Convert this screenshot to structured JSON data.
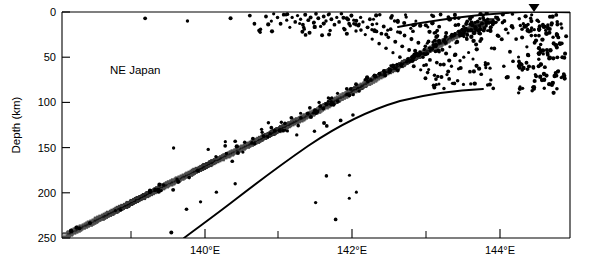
{
  "figure": {
    "region_label": "NE Japan",
    "background_color": "#ffffff",
    "ink_color": "#000000"
  },
  "chart_data": {
    "type": "scatter",
    "title": "",
    "subtitle": "",
    "annotations": [
      {
        "text": "NE Japan",
        "x": 138.75,
        "y": 62,
        "role": "region-label"
      },
      {
        "text": "▼",
        "x": 144.45,
        "y": 0,
        "role": "volcanic-front-marker"
      }
    ],
    "xlabel": "",
    "ylabel": "Depth (km)",
    "xlim": [
      138.3,
      144.9
    ],
    "ylim": [
      250,
      0
    ],
    "y_inverted": true,
    "grid": false,
    "legend": null,
    "xticks": [
      140,
      142,
      144
    ],
    "xtick_labels": [
      "140°E",
      "142°E",
      "144°E"
    ],
    "x_minor_ticks": [
      139,
      141,
      143
    ],
    "yticks": [
      0,
      50,
      100,
      150,
      200,
      250
    ],
    "ytick_labels": [
      "0",
      "50",
      "100",
      "150",
      "200",
      "250"
    ],
    "series": [
      {
        "name": "earthquake hypocenters",
        "marker": "filled-circle",
        "color": "#000000",
        "points": [
          [
            139.38,
            7
          ],
          [
            139.93,
            10
          ],
          [
            140.49,
            7
          ],
          [
            140.74,
            4
          ],
          [
            140.8,
            13
          ],
          [
            140.88,
            19
          ],
          [
            140.95,
            5
          ],
          [
            141.02,
            10
          ],
          [
            141.05,
            2
          ],
          [
            141.1,
            6
          ],
          [
            141.14,
            13
          ],
          [
            141.18,
            3
          ],
          [
            141.22,
            9
          ],
          [
            141.26,
            17
          ],
          [
            141.29,
            6
          ],
          [
            141.33,
            11
          ],
          [
            141.36,
            4
          ],
          [
            141.4,
            8
          ],
          [
            141.43,
            14
          ],
          [
            141.46,
            3
          ],
          [
            141.5,
            9
          ],
          [
            141.53,
            6
          ],
          [
            141.57,
            12
          ],
          [
            141.6,
            2
          ],
          [
            141.63,
            7
          ],
          [
            141.66,
            16
          ],
          [
            141.7,
            5
          ],
          [
            141.73,
            10
          ],
          [
            141.76,
            3
          ],
          [
            141.8,
            8
          ],
          [
            141.84,
            14
          ],
          [
            141.87,
            6
          ],
          [
            141.9,
            11
          ],
          [
            141.93,
            2
          ],
          [
            141.96,
            18
          ],
          [
            142.0,
            7
          ],
          [
            142.03,
            13
          ],
          [
            142.06,
            4
          ],
          [
            142.09,
            9
          ],
          [
            142.12,
            21
          ],
          [
            142.15,
            15
          ],
          [
            142.18,
            6
          ],
          [
            142.21,
            11
          ],
          [
            142.24,
            25
          ],
          [
            142.27,
            17
          ],
          [
            142.3,
            8
          ],
          [
            142.33,
            30
          ],
          [
            142.36,
            20
          ],
          [
            142.39,
            13
          ],
          [
            142.42,
            35
          ],
          [
            142.45,
            24
          ],
          [
            142.48,
            16
          ],
          [
            142.51,
            40
          ],
          [
            142.54,
            28
          ],
          [
            142.57,
            19
          ],
          [
            142.6,
            45
          ],
          [
            142.63,
            33
          ],
          [
            142.66,
            22
          ],
          [
            142.69,
            50
          ],
          [
            142.72,
            38
          ],
          [
            142.75,
            26
          ],
          [
            142.78,
            55
          ],
          [
            142.81,
            42
          ],
          [
            142.84,
            30
          ],
          [
            142.87,
            60
          ],
          [
            142.9,
            46
          ],
          [
            142.93,
            34
          ],
          [
            142.96,
            64
          ],
          [
            142.99,
            50
          ],
          [
            143.02,
            38
          ],
          [
            143.05,
            67
          ],
          [
            143.08,
            53
          ],
          [
            143.11,
            41
          ],
          [
            143.14,
            70
          ],
          [
            143.17,
            56
          ],
          [
            143.2,
            44
          ],
          [
            143.23,
            72
          ],
          [
            143.26,
            58
          ],
          [
            143.29,
            46
          ],
          [
            143.33,
            74
          ],
          [
            143.36,
            60
          ],
          [
            143.4,
            48
          ],
          [
            143.44,
            76
          ],
          [
            143.48,
            62
          ],
          [
            143.52,
            50
          ],
          [
            143.56,
            30
          ],
          [
            143.6,
            66
          ],
          [
            143.64,
            52
          ],
          [
            143.68,
            36
          ],
          [
            143.72,
            20
          ],
          [
            143.8,
            56
          ],
          [
            143.88,
            40
          ],
          [
            143.96,
            26
          ],
          [
            144.04,
            60
          ],
          [
            144.12,
            44
          ],
          [
            144.2,
            30
          ],
          [
            144.28,
            64
          ],
          [
            144.36,
            48
          ],
          [
            144.44,
            34
          ],
          [
            144.52,
            58
          ],
          [
            144.6,
            42
          ],
          [
            144.68,
            28
          ],
          [
            144.74,
            66
          ],
          [
            144.8,
            50
          ],
          [
            140.2,
            152
          ],
          [
            140.3,
            160
          ],
          [
            140.42,
            148
          ],
          [
            140.55,
            143
          ],
          [
            140.65,
            155
          ],
          [
            140.78,
            140
          ],
          [
            140.9,
            133
          ],
          [
            141.02,
            128
          ],
          [
            141.15,
            122
          ],
          [
            141.28,
            117
          ],
          [
            141.4,
            112
          ],
          [
            141.52,
            106
          ],
          [
            141.64,
            100
          ],
          [
            141.76,
            95
          ],
          [
            141.88,
            90
          ],
          [
            142.0,
            85
          ],
          [
            142.12,
            80
          ],
          [
            142.24,
            75
          ],
          [
            142.36,
            70
          ],
          [
            142.48,
            65
          ],
          [
            140.1,
            210
          ],
          [
            139.72,
            244
          ],
          [
            140.55,
            190
          ],
          [
            141.35,
            136
          ],
          [
            141.58,
            132
          ],
          [
            141.74,
            126
          ],
          [
            141.92,
            120
          ],
          [
            142.08,
            114
          ]
        ],
        "count_approx": 430
      }
    ],
    "curves": [
      {
        "name": "subducting-slab-hachured-band",
        "style": "hachured-band",
        "description": "Dashed/hachured band marking the upper surface of the subducting Pacific plate, dipping from upper right to lower left",
        "path": [
          [
            138.35,
            247
          ],
          [
            139.5,
            198
          ],
          [
            140.6,
            152
          ],
          [
            141.6,
            110
          ],
          [
            142.4,
            72
          ],
          [
            143.0,
            45
          ],
          [
            143.5,
            22
          ],
          [
            143.9,
            8
          ]
        ]
      },
      {
        "name": "upper-solid-contour",
        "style": "solid-line",
        "description": "Solid curve rising from the slab cluster to the surface near the volcanic front marker",
        "path": [
          [
            142.3,
            26
          ],
          [
            142.8,
            18
          ],
          [
            143.4,
            12
          ],
          [
            144.0,
            7
          ],
          [
            144.45,
            4
          ],
          [
            144.9,
            5
          ]
        ]
      },
      {
        "name": "lower-solid-contour",
        "style": "solid-line",
        "description": "Solid curve rising from 250 km depth near 139.9E, flattening near 88 km depth at about 144.1E",
        "path": [
          [
            139.88,
            250
          ],
          [
            140.6,
            212
          ],
          [
            141.4,
            172
          ],
          [
            142.2,
            136
          ],
          [
            143.0,
            108
          ],
          [
            143.6,
            94
          ],
          [
            144.1,
            88
          ]
        ]
      }
    ]
  }
}
